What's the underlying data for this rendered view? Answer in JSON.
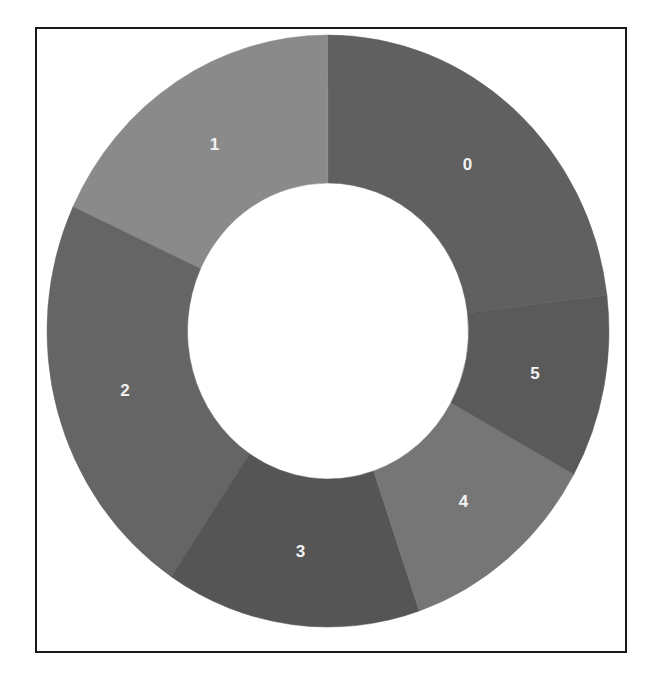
{
  "chart_data": {
    "type": "pie",
    "variant": "donut",
    "title": "",
    "xlabel": "",
    "ylabel": "",
    "categories": [
      "0",
      "1",
      "2",
      "3",
      "4",
      "5"
    ],
    "values": [
      23.1,
      18.1,
      22.5,
      14.7,
      11.7,
      10.0
    ],
    "unit": "percent (estimated from slice angles)",
    "colors": [
      "#606060",
      "#8a8a8a",
      "#656565",
      "#555555",
      "#767676",
      "#5a5a5a"
    ],
    "label_color": "#f2f2f2",
    "direction": "counterclockwise",
    "start_slice_end_angle_deg_clockwise_from_top": 83,
    "hole_ratio": 0.5,
    "legend": "none",
    "grid": false
  },
  "geometry": {
    "cx": 328,
    "cy": 331,
    "rx": 281,
    "ry": 296,
    "label_radius_ratio": 0.75
  }
}
